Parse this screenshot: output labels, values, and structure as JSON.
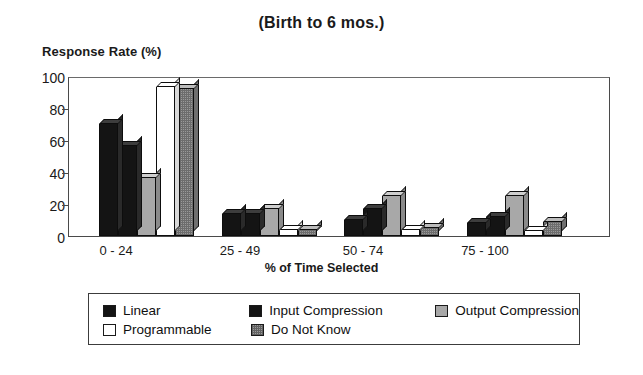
{
  "chart_data": {
    "type": "bar",
    "title": "(Birth to 6 mos.)",
    "xlabel": "% of Time Selected",
    "ylabel": "Response Rate (%)",
    "categories": [
      "0 - 24",
      "25 - 49",
      "50 - 74",
      "75 - 100"
    ],
    "ylim": [
      0,
      100
    ],
    "yticks": [
      "0",
      "20",
      "40",
      "60",
      "80",
      "100"
    ],
    "grid": false,
    "legend_position": "bottom",
    "series": [
      {
        "name": "Linear",
        "color": "#141414",
        "values": [
          70,
          14,
          10,
          8
        ]
      },
      {
        "name": "Input Compression",
        "color": "#141414",
        "values": [
          56,
          14,
          17,
          12
        ]
      },
      {
        "name": "Output Compression",
        "color": "#a8a8a8",
        "values": [
          36,
          17,
          25,
          25
        ]
      },
      {
        "name": "Programmable",
        "color": "#ffffff",
        "values": [
          93,
          4,
          4,
          3
        ]
      },
      {
        "name": "Do Not Know",
        "color": "#9a9a9a",
        "values": [
          92,
          4,
          5,
          9
        ]
      }
    ]
  }
}
